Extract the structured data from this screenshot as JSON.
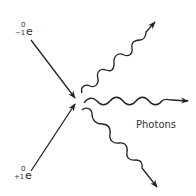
{
  "diagram": {
    "electron": {
      "symbol": "e",
      "mass_number": "0",
      "charge": "−1"
    },
    "positron": {
      "symbol": "e",
      "mass_number": "0",
      "charge": "+1"
    },
    "photons_label": "Photons",
    "photon_count": 3,
    "line_color": "#222222"
  }
}
